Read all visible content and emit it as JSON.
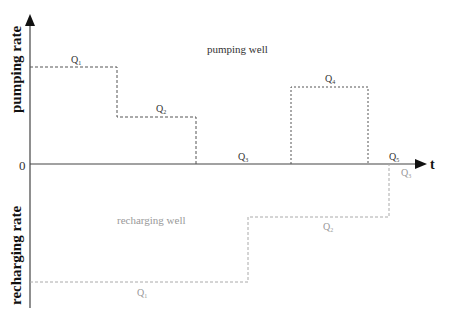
{
  "diagram": {
    "y_axis_top_label": "pumping rate",
    "y_axis_bottom_label": "recharging rate",
    "origin_label": "0",
    "x_axis_label": "t",
    "pumping_well_label": "pumping well",
    "recharging_well_label": "recharging well",
    "pumping_segments": [
      {
        "label": "Q",
        "sub": "1"
      },
      {
        "label": "Q",
        "sub": "2"
      },
      {
        "label": "Q",
        "sub": "3"
      },
      {
        "label": "Q",
        "sub": "4"
      },
      {
        "label": "Q",
        "sub": "5"
      }
    ],
    "recharging_segments": [
      {
        "label": "Q",
        "sub": "1"
      },
      {
        "label": "Q",
        "sub": "2"
      },
      {
        "label": "Q",
        "sub": "3"
      }
    ],
    "colors": {
      "axis": "#444444",
      "pumping_line": "#555555",
      "recharging_line": "#aaaaaa",
      "pumping_text": "#333333",
      "recharging_text": "#999999"
    }
  }
}
